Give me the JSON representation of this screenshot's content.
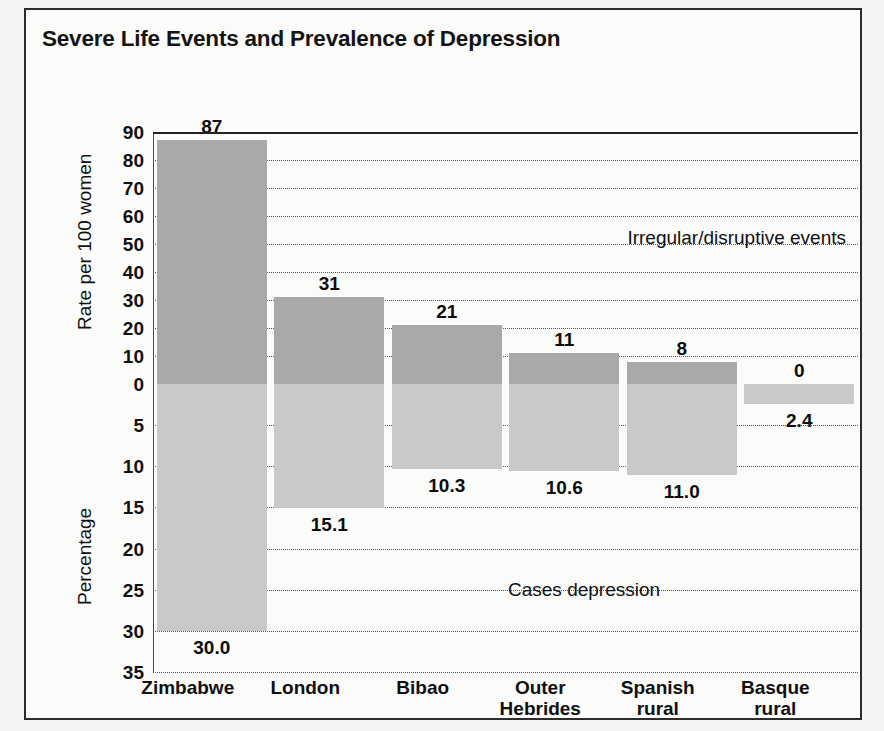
{
  "figure": {
    "title": "Severe Life Events and Prevalence of Depression"
  },
  "ghost_text": {
    "line1": "Cultural Setting/Action",
    "line2": "Prevalence of Depression"
  },
  "chart_data": {
    "type": "bar",
    "title": "Severe Life Events and Prevalence of Depression",
    "xlabel": "",
    "categories": [
      "Zimbabwe",
      "London",
      "Bibao",
      "Outer Hebrides",
      "Spanish rural",
      "Basque rural"
    ],
    "category_lines": [
      [
        "Zimbabwe"
      ],
      [
        "London"
      ],
      [
        "Bibao"
      ],
      [
        "Outer",
        "Hebrides"
      ],
      [
        "Spanish",
        "rural"
      ],
      [
        "Basque",
        "rural"
      ]
    ],
    "grid": true,
    "legend_position": "in-plot-annotations",
    "series": [
      {
        "name": "Irregular/disruptive events",
        "axis": "top",
        "ylabel": "Rate per 100 women",
        "ylim": [
          0,
          90
        ],
        "yticks": [
          90,
          80,
          70,
          60,
          50,
          40,
          30,
          20,
          10,
          0
        ],
        "color": "#a9a9a9",
        "values": [
          87,
          31,
          21,
          11,
          8,
          0
        ],
        "value_labels": [
          "87",
          "31",
          "21",
          "11",
          "8",
          "0"
        ]
      },
      {
        "name": "Cases depression",
        "axis": "bottom",
        "ylabel": "Percentage",
        "ylim": [
          0,
          35
        ],
        "yticks": [
          0,
          5,
          10,
          15,
          20,
          25,
          30,
          35
        ],
        "color": "#c9c9c9",
        "values": [
          30.0,
          15.1,
          10.3,
          10.6,
          11.0,
          2.4
        ],
        "value_labels": [
          "30.0",
          "15.1",
          "10.3",
          "10.6",
          "11.0",
          "2.4"
        ]
      }
    ],
    "annotations": [
      {
        "text": "Irregular/disruptive events",
        "x_frac": 0.64,
        "y_value": 52,
        "axis": "top"
      },
      {
        "text": "Cases depression",
        "x_frac": 0.6,
        "y_value": 25,
        "axis": "bottom"
      }
    ]
  },
  "axes": {
    "top": {
      "label": "Rate per 100 women",
      "ticks": [
        "90",
        "80",
        "70",
        "60",
        "50",
        "40",
        "30",
        "20",
        "10",
        "0"
      ]
    },
    "bottom": {
      "label": "Percentage",
      "ticks": [
        "5",
        "10",
        "15",
        "20",
        "25",
        "30",
        "35"
      ]
    }
  },
  "annotations": {
    "top_series": "Irregular/disruptive events",
    "bottom_series": "Cases depression"
  }
}
